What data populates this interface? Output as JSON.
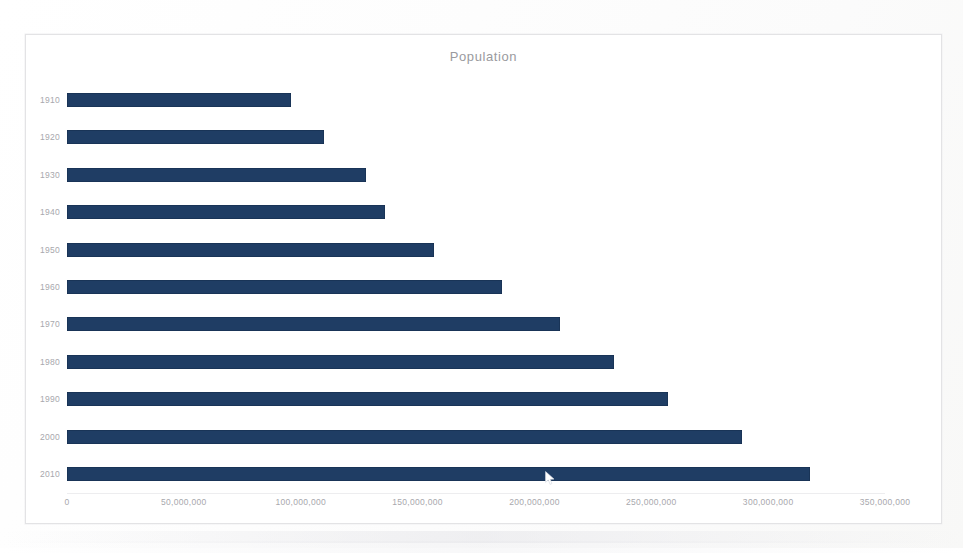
{
  "chart_data": {
    "type": "bar",
    "orientation": "horizontal",
    "title": "Population",
    "xlabel": "",
    "ylabel": "",
    "categories": [
      "1910",
      "1920",
      "1930",
      "1940",
      "1950",
      "1960",
      "1970",
      "1980",
      "1990",
      "2000",
      "2010"
    ],
    "values": [
      96000000,
      110000000,
      128000000,
      136000000,
      157000000,
      186000000,
      211000000,
      234000000,
      257000000,
      289000000,
      318000000
    ],
    "xlim": [
      0,
      350000000
    ],
    "x_ticks": [
      0,
      50000000,
      100000000,
      150000000,
      200000000,
      250000000,
      300000000,
      350000000
    ],
    "x_tick_labels": [
      "0",
      "50,000,000",
      "100,000,000",
      "150,000,000",
      "200,000,000",
      "250,000,000",
      "300,000,000",
      "350,000,000"
    ],
    "grid": false,
    "legend": "none",
    "series": [
      {
        "name": "Population",
        "color": "#1f3d64",
        "values": [
          96000000,
          110000000,
          128000000,
          136000000,
          157000000,
          186000000,
          211000000,
          234000000,
          257000000,
          289000000,
          318000000
        ]
      }
    ]
  },
  "colors": {
    "bar": "#1f3d64",
    "axis_text": "#a8a8ad",
    "title_text": "#9a9a9e",
    "frame_border": "#e3e3e5",
    "page_background": "#ffffff"
  },
  "cursor": {
    "icon": "mouse-pointer-icon",
    "x": 548,
    "y": 477
  }
}
